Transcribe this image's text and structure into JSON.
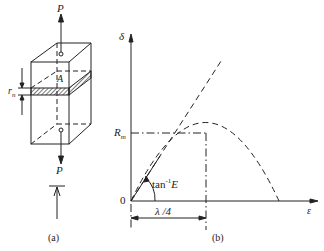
{
  "figure_a": {
    "caption": "(a)",
    "force_top": "P",
    "force_bottom": "P",
    "area_label": "A",
    "thickness_label": "r",
    "thickness_subscript": "n"
  },
  "figure_b": {
    "caption": "(b)",
    "y_axis_label": "δ",
    "x_axis_label": "ε",
    "origin_label": "0",
    "max_label": "R",
    "max_subscript": "m",
    "slope_label": "tan",
    "slope_superscript": "-1",
    "slope_var": "E",
    "span_label": "λ /4"
  },
  "colors": {
    "ink": "#222222",
    "background": "#ffffff"
  }
}
